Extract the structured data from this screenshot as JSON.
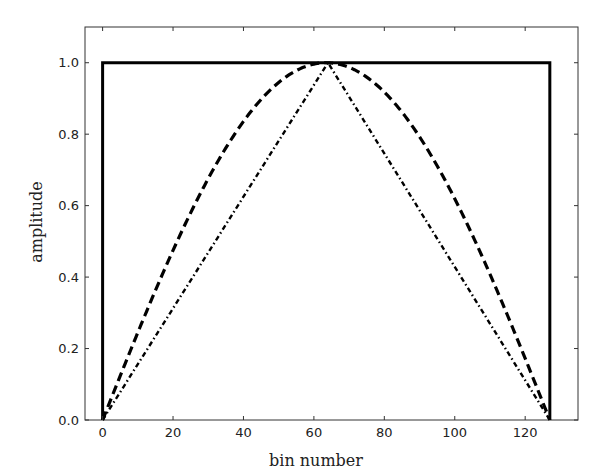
{
  "chart_data": {
    "type": "line",
    "title": "",
    "xlabel": "bin number",
    "ylabel": "amplitude",
    "xlim": [
      -5,
      135
    ],
    "ylim": [
      0,
      1.1
    ],
    "grid": false,
    "legend": null,
    "x_ticks": [
      0,
      20,
      40,
      60,
      80,
      100,
      120
    ],
    "x_tick_labels": [
      "0",
      "20",
      "40",
      "60",
      "80",
      "100",
      "120"
    ],
    "y_ticks": [
      0.0,
      0.2,
      0.4,
      0.6,
      0.8,
      1.0
    ],
    "y_tick_labels": [
      "0.0",
      "0.2",
      "0.4",
      "0.6",
      "0.8",
      "1.0"
    ],
    "series": [
      {
        "name": "rectangular window",
        "style": "solid",
        "color": "#000000",
        "x": [
          0,
          0,
          127,
          127
        ],
        "y": [
          0.0,
          1.0,
          1.0,
          0.0
        ]
      },
      {
        "name": "sine window",
        "style": "dashed",
        "color": "#000000",
        "function": "sin(pi*n/127)",
        "x": [
          0,
          8,
          16,
          24,
          32,
          40,
          48,
          56,
          63.5,
          72,
          80,
          88,
          96,
          104,
          112,
          120,
          127
        ],
        "y": [
          0.0,
          0.2,
          0.38,
          0.56,
          0.71,
          0.84,
          0.93,
          0.99,
          1.0,
          0.98,
          0.92,
          0.83,
          0.7,
          0.55,
          0.37,
          0.17,
          0.0
        ]
      },
      {
        "name": "triangular window",
        "style": "dashdot",
        "color": "#000000",
        "x": [
          0,
          64,
          127
        ],
        "y": [
          0.0,
          1.0,
          0.0
        ]
      }
    ]
  }
}
